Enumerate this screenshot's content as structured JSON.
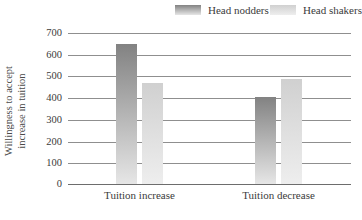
{
  "chart_data": {
    "type": "bar",
    "categories": [
      "Tuition increase",
      "Tuition decrease"
    ],
    "series": [
      {
        "name": "Head nodders",
        "values": [
          645,
          400
        ]
      },
      {
        "name": "Head shakers",
        "values": [
          467,
          485
        ]
      }
    ],
    "title": "",
    "xlabel": "",
    "ylabel": "Willingness to accept increase in tuition",
    "ylabel_lines": [
      "Willingness to accept",
      "increase in tuition"
    ],
    "yticks": [
      0,
      100,
      200,
      300,
      400,
      500,
      600,
      700
    ],
    "ylim": [
      0,
      700
    ],
    "grid": true,
    "legend_position": "top-right",
    "colors": {
      "head_nodders_gradient_top": "#828282",
      "head_nodders_gradient_bottom": "#e6e6e6",
      "head_shakers_gradient_top": "#d0d0d0",
      "head_shakers_gradient_bottom": "#eeeeee",
      "gridline": "#8f8f8f",
      "axis_line": "#6d6d6d",
      "text": "#3b3b3b"
    }
  }
}
